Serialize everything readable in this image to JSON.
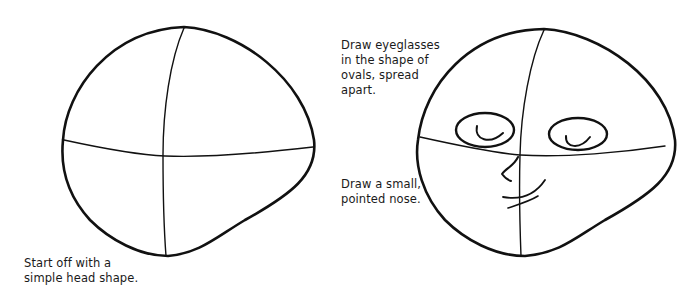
{
  "illustration": {
    "stroke_color": "#111111",
    "guide_color": "#333333",
    "panels": [
      {
        "id": "step-1",
        "caption_lines": [
          "Start off with a",
          "simple head shape."
        ]
      },
      {
        "id": "step-2",
        "captions": [
          {
            "id": "glasses",
            "lines": [
              "Draw eyeglasses",
              "in the shape of",
              "ovals, spread",
              "apart."
            ]
          },
          {
            "id": "nose",
            "lines": [
              "Draw a small,",
              "pointed nose."
            ]
          }
        ]
      }
    ]
  }
}
